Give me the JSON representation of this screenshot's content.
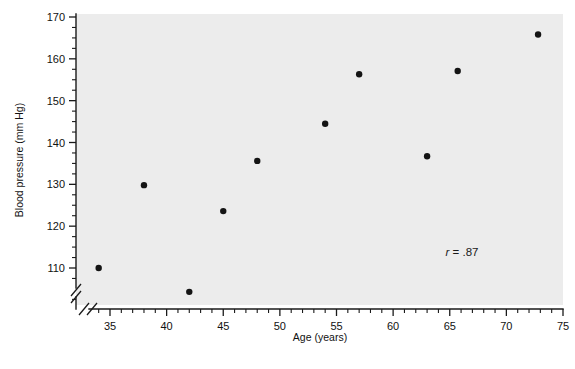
{
  "chart_data": {
    "type": "scatter",
    "title": "",
    "xlabel": "Age (years)",
    "ylabel": "Blood pressure (mm Hg)",
    "xlim": [
      32.5,
      75
    ],
    "ylim": [
      102,
      170
    ],
    "x_major_ticks": [
      35,
      40,
      45,
      50,
      55,
      60,
      65,
      70,
      75
    ],
    "y_major_ticks": [
      110,
      120,
      130,
      140,
      150,
      160,
      170
    ],
    "x_tick_labels": [
      "35",
      "40",
      "45",
      "50",
      "55",
      "60",
      "65",
      "70",
      "75"
    ],
    "y_tick_labels": [
      "110",
      "120",
      "130",
      "140",
      "150",
      "160",
      "170"
    ],
    "x_minor_tick_step": 1,
    "y_minor_tick_step": 2.5,
    "x_axis_break": true,
    "y_axis_break": true,
    "grid": false,
    "legend": null,
    "x": [
      34,
      38,
      42,
      45,
      48,
      54,
      57,
      63,
      65.7,
      72.8
    ],
    "y": [
      110,
      129.8,
      104.3,
      123.6,
      135.6,
      144.5,
      156.3,
      136.7,
      157.1,
      165.8
    ],
    "points": [
      {
        "x": 34,
        "y": 110
      },
      {
        "x": 38,
        "y": 129.8
      },
      {
        "x": 42,
        "y": 104.3
      },
      {
        "x": 45,
        "y": 123.6
      },
      {
        "x": 48,
        "y": 135.6
      },
      {
        "x": 54,
        "y": 144.5
      },
      {
        "x": 57,
        "y": 156.3
      },
      {
        "x": 63,
        "y": 136.7
      },
      {
        "x": 65.7,
        "y": 157.1
      },
      {
        "x": 72.8,
        "y": 165.8
      }
    ],
    "annotations": [
      {
        "name": "correlation",
        "symbol": "r",
        "text": " = .87",
        "full_text": "r = .87",
        "value": 0.87
      }
    ],
    "marker": {
      "shape": "circle",
      "color": "#141414",
      "size": 6.4
    },
    "plot_background_color": "#ececec",
    "axis_color": "#1a1a1a"
  }
}
